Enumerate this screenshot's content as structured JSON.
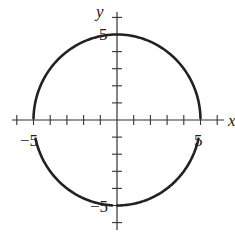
{
  "chart_data": {
    "type": "line",
    "title": "",
    "xlabel": "x",
    "ylabel": "y",
    "xlim": [
      -6,
      6
    ],
    "ylim": [
      -6,
      6
    ],
    "grid": false,
    "legend": null,
    "x_tick_step": 1,
    "y_tick_step": 1,
    "x_tick_labels": [
      {
        "value": -5,
        "label": "−5"
      },
      {
        "value": 5,
        "label": "5"
      }
    ],
    "y_tick_labels": [
      {
        "value": 5,
        "label": "5"
      },
      {
        "value": -5,
        "label": "−5"
      }
    ],
    "series": [
      {
        "name": "circle",
        "equation": "x^2 + y^2 = 25",
        "center": [
          0,
          0
        ],
        "radius": 5,
        "color": "#222222"
      }
    ]
  },
  "labels": {
    "x_axis": "x",
    "y_axis": "y",
    "x_neg5": "−5",
    "x_pos5": "5",
    "y_pos5": "5",
    "y_neg5": "−5"
  }
}
